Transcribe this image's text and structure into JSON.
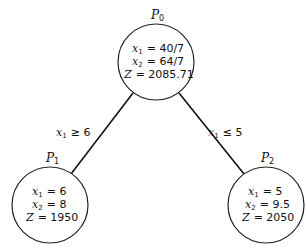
{
  "nodes": [
    {
      "id": "P0",
      "label": "P",
      "sub": "0",
      "cx": 156,
      "cy": 62,
      "r": 38,
      "lines": [
        {
          "var": "x",
          "sub": "1",
          "eq": "= 40/7"
        },
        {
          "var": "x",
          "sub": "2",
          "eq": "= 64/7"
        },
        {
          "var": "Z",
          "sub": "",
          "eq": "= 2085.71"
        }
      ]
    },
    {
      "id": "P1",
      "label": "P",
      "sub": "1",
      "cx": 50,
      "cy": 205,
      "r": 38,
      "lines": [
        {
          "var": "x",
          "sub": "1",
          "eq": "= 6"
        },
        {
          "var": "x",
          "sub": "2",
          "eq": "= 8"
        },
        {
          "var": "Z",
          "sub": "",
          "eq": "= 1950"
        }
      ]
    },
    {
      "id": "P2",
      "label": "P",
      "sub": "2",
      "cx": 266,
      "cy": 205,
      "r": 38,
      "lines": [
        {
          "var": "x",
          "sub": "1",
          "eq": "= 5"
        },
        {
          "var": "x",
          "sub": "2",
          "eq": "= 9.5"
        },
        {
          "var": "Z",
          "sub": "",
          "eq": "= 2050"
        }
      ]
    }
  ],
  "edges": [
    {
      "from": "P0",
      "to": "P1",
      "var": "x",
      "sub": "1",
      "cond": "≥ 6"
    },
    {
      "from": "P0",
      "to": "P2",
      "var": "x",
      "sub": "1",
      "cond": "≤ 5"
    }
  ]
}
